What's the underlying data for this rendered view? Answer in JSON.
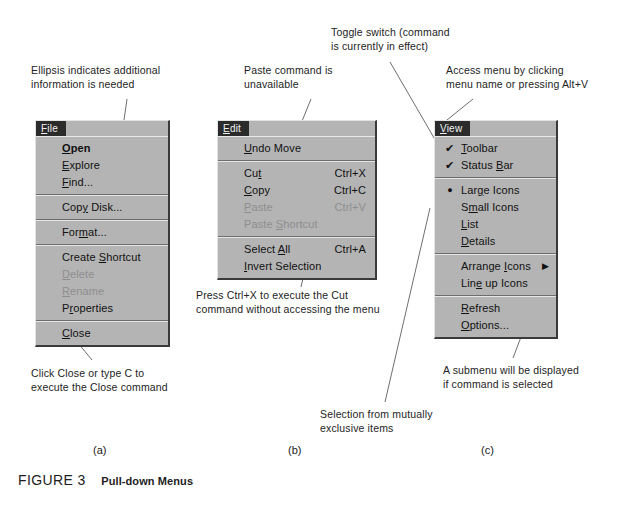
{
  "figure": {
    "number": "FIGURE 3",
    "title": "Pull-down Menus"
  },
  "part_labels": {
    "a": "(a)",
    "b": "(b)",
    "c": "(c)"
  },
  "annotations": {
    "ellipsis": "Ellipsis indicates additional\ninformation is needed",
    "paste_unavailable": "Paste command is\nunavailable",
    "toggle_switch": "Toggle switch (command\nis currently in effect)",
    "access_menu": "Access menu by clicking\nmenu name or pressing  Alt+V",
    "click_close": "Click Close or type C to\nexecute the Close command",
    "press_ctrl_x": "Press Ctrl+X to execute the Cut\ncommand without accessing the menu",
    "mutually_exclusive": "Selection from mutually\nexclusive items",
    "submenu": "A submenu will be displayed\nif command is selected"
  },
  "colors": {
    "menu_face": "#b4b4b4",
    "menu_title_bg": "#2b2b2b",
    "menu_title_fg": "#f2f2f2",
    "text": "#111111",
    "disabled_text": "#8e8e8e",
    "separator_dark": "#6d6d6d",
    "separator_light": "#e6e6e6",
    "page_bg": "#ffffff"
  },
  "menus": {
    "file": {
      "title": "File",
      "title_mnemonic_index": 0,
      "items": [
        {
          "label": "Open",
          "mnemonic": "O",
          "state": "bold",
          "accel": "",
          "mark": ""
        },
        {
          "label": "Explore",
          "mnemonic": "E",
          "state": "normal",
          "accel": "",
          "mark": ""
        },
        {
          "label": "Find...",
          "mnemonic": "F",
          "state": "normal",
          "accel": "",
          "mark": ""
        },
        {
          "separator": true
        },
        {
          "label": "Copy Disk...",
          "mnemonic": "y",
          "state": "normal",
          "accel": "",
          "mark": ""
        },
        {
          "separator": true
        },
        {
          "label": "Format...",
          "mnemonic": "m",
          "state": "normal",
          "accel": "",
          "mark": ""
        },
        {
          "separator": true
        },
        {
          "label": "Create Shortcut",
          "mnemonic": "S",
          "state": "normal",
          "accel": "",
          "mark": ""
        },
        {
          "label": "Delete",
          "mnemonic": "D",
          "state": "disabled",
          "accel": "",
          "mark": ""
        },
        {
          "label": "Rename",
          "mnemonic": "R",
          "state": "disabled",
          "accel": "",
          "mark": ""
        },
        {
          "label": "Properties",
          "mnemonic": "r",
          "state": "normal",
          "accel": "",
          "mark": ""
        },
        {
          "separator": true
        },
        {
          "label": "Close",
          "mnemonic": "C",
          "state": "normal",
          "accel": "",
          "mark": ""
        }
      ]
    },
    "edit": {
      "title": "Edit",
      "title_mnemonic_index": 0,
      "items": [
        {
          "label": "Undo Move",
          "mnemonic": "U",
          "state": "normal",
          "accel": "",
          "mark": ""
        },
        {
          "separator": true
        },
        {
          "label": "Cut",
          "mnemonic": "t",
          "state": "normal",
          "accel": "Ctrl+X",
          "mark": ""
        },
        {
          "label": "Copy",
          "mnemonic": "C",
          "state": "normal",
          "accel": "Ctrl+C",
          "mark": ""
        },
        {
          "label": "Paste",
          "mnemonic": "P",
          "state": "disabled",
          "accel": "Ctrl+V",
          "mark": ""
        },
        {
          "label": "Paste Shortcut",
          "mnemonic": "S",
          "state": "disabled",
          "accel": "",
          "mark": ""
        },
        {
          "separator": true
        },
        {
          "label": "Select All",
          "mnemonic": "A",
          "state": "normal",
          "accel": "Ctrl+A",
          "mark": ""
        },
        {
          "label": "Invert Selection",
          "mnemonic": "I",
          "state": "normal",
          "accel": "",
          "mark": ""
        }
      ]
    },
    "view": {
      "title": "View",
      "title_mnemonic_index": 0,
      "items": [
        {
          "label": "Toolbar",
          "mnemonic": "T",
          "state": "normal",
          "accel": "",
          "mark": "check"
        },
        {
          "label": "Status Bar",
          "mnemonic": "B",
          "state": "normal",
          "accel": "",
          "mark": "check"
        },
        {
          "separator": true
        },
        {
          "label": "Large Icons",
          "mnemonic": "g",
          "state": "normal",
          "accel": "",
          "mark": "radio"
        },
        {
          "label": "Small Icons",
          "mnemonic": "m",
          "state": "normal",
          "accel": "",
          "mark": ""
        },
        {
          "label": "List",
          "mnemonic": "L",
          "state": "normal",
          "accel": "",
          "mark": ""
        },
        {
          "label": "Details",
          "mnemonic": "D",
          "state": "normal",
          "accel": "",
          "mark": ""
        },
        {
          "separator": true
        },
        {
          "label": "Arrange Icons",
          "mnemonic": "I",
          "state": "normal",
          "accel": "",
          "mark": "",
          "submenu": true
        },
        {
          "label": "Line up Icons",
          "mnemonic": "e",
          "state": "normal",
          "accel": "",
          "mark": ""
        },
        {
          "separator": true
        },
        {
          "label": "Refresh",
          "mnemonic": "R",
          "state": "normal",
          "accel": "",
          "mark": ""
        },
        {
          "label": "Options...",
          "mnemonic": "O",
          "state": "normal",
          "accel": "",
          "mark": ""
        }
      ]
    }
  }
}
